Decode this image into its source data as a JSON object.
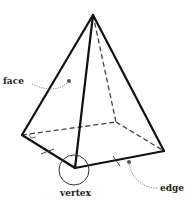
{
  "diagram": {
    "labels": {
      "face": "face",
      "vertex": "vertex",
      "edge": "edge"
    },
    "colors": {
      "line": "#111111",
      "hidden": "#444444",
      "leader": "#777777",
      "text": "#222222"
    },
    "vertices": {
      "apex": [
        93,
        15
      ],
      "left": [
        22,
        135
      ],
      "front": [
        75,
        168
      ],
      "right": [
        164,
        151
      ],
      "back": [
        116,
        122
      ]
    }
  }
}
